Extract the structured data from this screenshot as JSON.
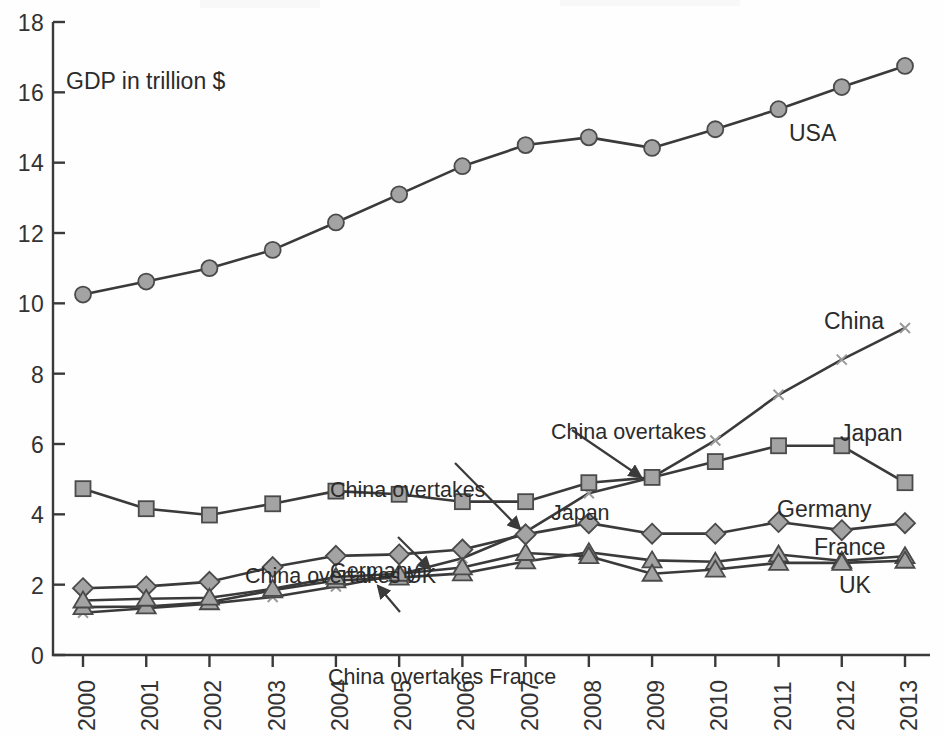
{
  "chart_data": {
    "type": "line",
    "title": "",
    "subtitle": "",
    "axis_title": "GDP in trillion $",
    "xlabel": "",
    "ylabel": "GDP in trillion $",
    "categories": [
      "2000",
      "2001",
      "2002",
      "2003",
      "2004",
      "2005",
      "2006",
      "2007",
      "2008",
      "2009",
      "2010",
      "2011",
      "2012",
      "2013"
    ],
    "x": [
      2000,
      2001,
      2002,
      2003,
      2004,
      2005,
      2006,
      2007,
      2008,
      2009,
      2010,
      2011,
      2012,
      2013
    ],
    "ylim": [
      0,
      18
    ],
    "yticks": [
      0,
      2,
      4,
      6,
      8,
      10,
      12,
      14,
      16,
      18
    ],
    "ytick_labels": [
      "0",
      "2",
      "4",
      "6",
      "8",
      "10",
      "12",
      "14",
      "16",
      "18"
    ],
    "xlim": [
      2000,
      2013
    ],
    "grid": false,
    "legend_position": "inline-right-of-line-ends",
    "series": [
      {
        "name": "USA",
        "marker": "circle",
        "color": "#a3a3a3",
        "values": [
          10.25,
          10.62,
          11.0,
          11.52,
          12.3,
          13.1,
          13.9,
          14.5,
          14.72,
          14.42,
          14.95,
          15.52,
          16.15,
          16.75
        ]
      },
      {
        "name": "China",
        "marker": "star",
        "color": "#a3a3a3",
        "values": [
          1.2,
          1.33,
          1.46,
          1.65,
          1.95,
          2.29,
          2.75,
          3.5,
          4.6,
          5.05,
          6.1,
          7.4,
          8.4,
          9.3
        ]
      },
      {
        "name": "Japan",
        "marker": "square",
        "color": "#a3a3a3",
        "values": [
          4.73,
          4.16,
          3.98,
          4.3,
          4.66,
          4.57,
          4.36,
          4.36,
          4.9,
          5.05,
          5.5,
          5.95,
          5.95,
          4.9
        ]
      },
      {
        "name": "Germany",
        "marker": "diamond",
        "color": "#a3a3a3",
        "values": [
          1.9,
          1.95,
          2.08,
          2.5,
          2.82,
          2.86,
          3.0,
          3.43,
          3.75,
          3.45,
          3.45,
          3.78,
          3.55,
          3.75
        ]
      },
      {
        "name": "France",
        "marker": "triangle",
        "color": "#a3a3a3",
        "values": [
          1.36,
          1.38,
          1.5,
          1.84,
          2.12,
          2.2,
          2.32,
          2.66,
          2.92,
          2.69,
          2.65,
          2.86,
          2.68,
          2.81
        ]
      },
      {
        "name": "UK",
        "marker": "triangle",
        "color": "#a3a3a3",
        "values": [
          1.55,
          1.6,
          1.63,
          1.88,
          2.22,
          2.31,
          2.49,
          2.9,
          2.81,
          2.31,
          2.43,
          2.62,
          2.62,
          2.68
        ]
      }
    ],
    "annotations": [
      {
        "id": "china-overtakes-uk",
        "text": "China overtakes UK",
        "lines": [
          "China overtakes UK"
        ]
      },
      {
        "id": "china-overtakes-france",
        "text": "China overtakes France",
        "lines": [
          "China overtakes France"
        ]
      },
      {
        "id": "china-overtakes-germany",
        "text": "China overtakes Germany",
        "lines": [
          "China overtakes",
          "Germany"
        ]
      },
      {
        "id": "china-overtakes-japan",
        "text": "China overtakes Japan",
        "lines": [
          "China overtakes",
          "Japan"
        ]
      }
    ]
  },
  "labels": {
    "axis_title": "GDP in trillion $",
    "usa": "USA",
    "china": "China",
    "japan": "Japan",
    "germany": "Germany",
    "france": "France",
    "uk": "UK",
    "anno_uk_l1": "China overtakes UK",
    "anno_france_l1": "China overtakes France",
    "anno_germany_l1": "China overtakes",
    "anno_germany_l2": "Germany",
    "anno_japan_l1": "China overtakes",
    "anno_japan_l2": "Japan"
  },
  "yticks": {
    "t0": "0",
    "t2": "2",
    "t4": "4",
    "t6": "6",
    "t8": "8",
    "t10": "10",
    "t12": "12",
    "t14": "14",
    "t16": "16",
    "t18": "18"
  },
  "xticks": {
    "y2000": "2000",
    "y2001": "2001",
    "y2002": "2002",
    "y2003": "2003",
    "y2004": "2004",
    "y2005": "2005",
    "y2006": "2006",
    "y2007": "2007",
    "y2008": "2008",
    "y2009": "2009",
    "y2010": "2010",
    "y2011": "2011",
    "y2012": "2012",
    "y2013": "2013"
  },
  "colors": {
    "line": "#3a3a3a",
    "marker_fill": "#a3a3a3",
    "marker_stroke": "#4a4a4a",
    "axis": "#3a3a3a",
    "text": "#2b2b2b",
    "background": "#ffffff"
  }
}
